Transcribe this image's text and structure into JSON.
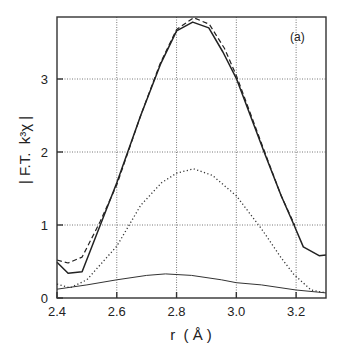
{
  "chart_data": {
    "type": "line",
    "title": "",
    "panel_label": "(a)",
    "xlabel": "r  ( Å )",
    "ylabel": "| F.T.  k³χ |",
    "xlim": [
      2.4,
      3.3
    ],
    "ylim": [
      0,
      3.85
    ],
    "xticks": [
      2.4,
      2.6,
      2.8,
      3.0,
      3.2
    ],
    "xtick_labels": [
      "2.4",
      "2.6",
      "2.8",
      "3.0",
      "3.2"
    ],
    "yticks": [
      0,
      1,
      2,
      3
    ],
    "ytick_labels": [
      "0",
      "1",
      "2",
      "3"
    ],
    "grid": true,
    "legend": null,
    "series": [
      {
        "name": "experimental (solid)",
        "style": "solid",
        "x": [
          2.4,
          2.437,
          2.484,
          2.545,
          2.6,
          2.68,
          2.746,
          2.8,
          2.854,
          2.908,
          2.955,
          3.0,
          3.093,
          3.15,
          3.193,
          3.224,
          3.277,
          3.3
        ],
        "y": [
          0.49,
          0.34,
          0.36,
          1.0,
          1.58,
          2.5,
          3.2,
          3.66,
          3.78,
          3.7,
          3.37,
          3.01,
          2.0,
          1.4,
          1.0,
          0.7,
          0.58,
          0.59
        ]
      },
      {
        "name": "fit (dashed)",
        "style": "dashed",
        "x": [
          2.4,
          2.437,
          2.484,
          2.545,
          2.6,
          2.68,
          2.746,
          2.8,
          2.857,
          2.91,
          2.96,
          3.0,
          3.095,
          3.15,
          3.195
        ],
        "y": [
          0.52,
          0.48,
          0.56,
          1.05,
          1.55,
          2.5,
          3.22,
          3.68,
          3.84,
          3.75,
          3.42,
          3.05,
          2.0,
          1.4,
          1.0
        ]
      },
      {
        "name": "shell component (dotted)",
        "style": "dotted",
        "x": [
          2.4,
          2.444,
          2.5,
          2.55,
          2.6,
          2.68,
          2.75,
          2.8,
          2.857,
          2.92,
          3.0,
          3.084,
          3.15,
          3.193,
          3.25,
          3.3
        ],
        "y": [
          0.19,
          0.14,
          0.25,
          0.48,
          0.71,
          1.27,
          1.58,
          1.71,
          1.77,
          1.68,
          1.4,
          0.95,
          0.55,
          0.32,
          0.11,
          0.07
        ]
      },
      {
        "name": "second component (thin)",
        "style": "thin",
        "x": [
          2.4,
          2.5,
          2.6,
          2.7,
          2.763,
          2.85,
          2.95,
          3.0,
          3.084,
          3.2,
          3.3
        ],
        "y": [
          0.12,
          0.18,
          0.25,
          0.31,
          0.33,
          0.31,
          0.25,
          0.21,
          0.18,
          0.11,
          0.07
        ]
      }
    ]
  }
}
